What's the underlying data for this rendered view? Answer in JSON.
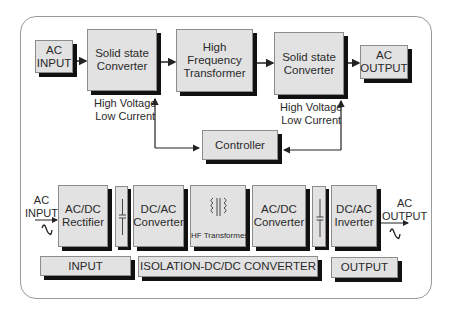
{
  "top_diagram": {
    "ac_input": [
      "AC",
      "INPUT"
    ],
    "converter1": [
      "Solid state",
      "Converter"
    ],
    "transformer": [
      "High Frequency",
      "Transformer"
    ],
    "converter2": [
      "Solid state",
      "Converter"
    ],
    "ac_output": [
      "AC",
      "OUTPUT"
    ],
    "annotation1": [
      "High Voltage",
      "Low Current"
    ],
    "annotation2": [
      "High Voltage",
      "Low Current"
    ],
    "controller": "Controller"
  },
  "bottom_diagram": {
    "ac_input_label": [
      "AC",
      "INPUT"
    ],
    "rectifier": [
      "AC/DC",
      "Rectifier"
    ],
    "dcac_converter": [
      "DC/AC",
      "Converter"
    ],
    "hf_transformer": "HF Transformes",
    "acdc_converter": [
      "AC/DC",
      "Converter"
    ],
    "inverter": [
      "DC/AC",
      "Inverter"
    ],
    "ac_output_label": [
      "AC",
      "OUTPUT"
    ],
    "sections": {
      "input": "INPUT",
      "isolation": "ISOLATION-DC/DC CONVERTER",
      "output": "OUTPUT"
    }
  },
  "icons": {
    "sine_wave": "ac-sine-wave-icon",
    "capacitor": "capacitor-icon",
    "transformer_coils": "transformer-coil-icon"
  }
}
